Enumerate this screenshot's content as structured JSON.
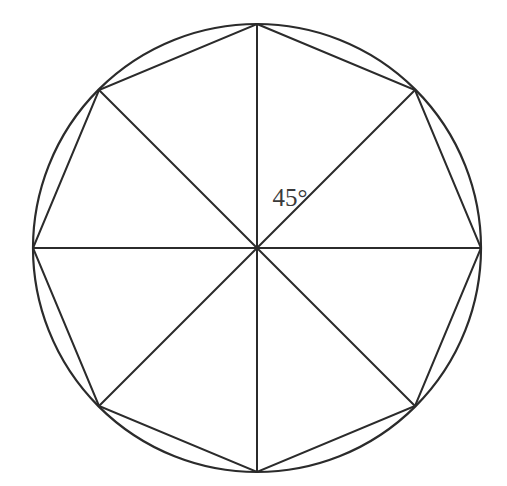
{
  "figure": {
    "name": "inscribed-regular-octagon",
    "background_color": "#ffffff",
    "line_color": "#2b2b2b",
    "text_color": "#3a3a3a"
  },
  "labels": {
    "central_angle": "45°"
  },
  "chart_data": {
    "type": "diagram",
    "title": "",
    "subtitle": "",
    "xlabel": "",
    "ylabel": "",
    "grid": false,
    "legend": "none",
    "shapes": [
      {
        "name": "circumscribed-circle",
        "kind": "circle",
        "center": [
          257,
          248
        ],
        "radius": 224
      },
      {
        "name": "inscribed-octagon",
        "kind": "polygon",
        "sides": 8,
        "regular": true,
        "vertices": [
          [
            257,
            24
          ],
          [
            415,
            90
          ],
          [
            481,
            248
          ],
          [
            415,
            406
          ],
          [
            257,
            472
          ],
          [
            99,
            406
          ],
          [
            33,
            248
          ],
          [
            99,
            90
          ]
        ]
      },
      {
        "name": "radii",
        "kind": "lines",
        "from": [
          257,
          248
        ],
        "to": [
          [
            257,
            24
          ],
          [
            415,
            90
          ],
          [
            481,
            248
          ],
          [
            415,
            406
          ],
          [
            257,
            472
          ],
          [
            99,
            406
          ],
          [
            33,
            248
          ],
          [
            99,
            90
          ]
        ],
        "count": 8
      }
    ],
    "annotations": [
      {
        "name": "central-angle-label",
        "text": "45°",
        "position": [
          290,
          200
        ],
        "describes": "central angle between adjacent radii of the regular octagon"
      }
    ],
    "values": {
      "number_of_sides": 8,
      "central_angle_degrees": 45,
      "total_degrees": 360,
      "circle_center_x": 257,
      "circle_center_y": 248,
      "circle_radius": 224
    }
  }
}
